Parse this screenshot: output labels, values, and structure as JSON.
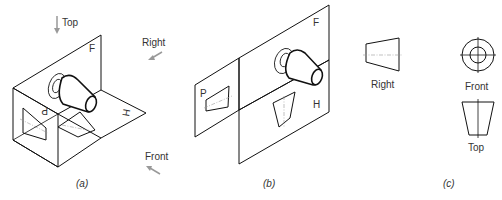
{
  "panel_a": {
    "caption": "(a)",
    "direction_labels": {
      "top": "Top",
      "right": "Right",
      "front": "Front"
    },
    "plane_labels": {
      "frontal": "F",
      "horizontal": "H",
      "profile": "P"
    }
  },
  "panel_b": {
    "caption": "(b)",
    "plane_labels": {
      "frontal": "F",
      "horizontal": "H",
      "profile": "P"
    }
  },
  "panel_c": {
    "caption": "(c)",
    "view_labels": {
      "right": "Right",
      "front": "Front",
      "top": "Top"
    }
  },
  "colors": {
    "line": "#111111",
    "arrow": "#999999",
    "centerline": "#999999",
    "text": "#333333"
  }
}
